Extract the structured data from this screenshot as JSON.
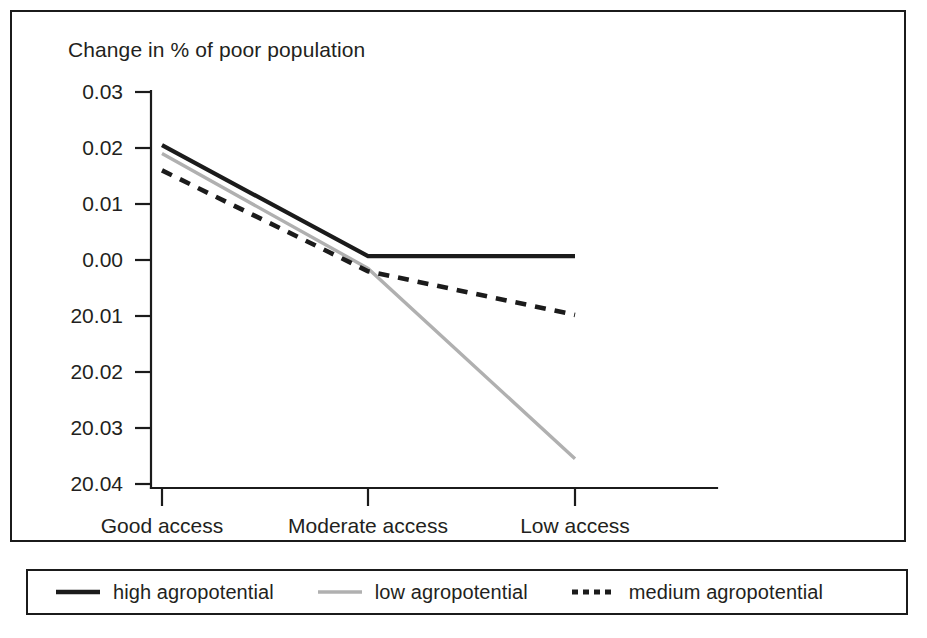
{
  "figure": {
    "title": "Change in % of poor population",
    "frame_color": "#1b1b1b",
    "background": "#ffffff"
  },
  "axes": {
    "y_tick_labels": [
      "0.03",
      "0.02",
      "0.01",
      "0.00",
      "20.01",
      "20.02",
      "20.03",
      "20.04"
    ],
    "x_tick_labels": [
      "Good access",
      "Moderate access",
      "Low access"
    ]
  },
  "legend": {
    "items": [
      {
        "label": "high agropotential",
        "color": "#1b1b1b",
        "style": "solid",
        "swatch": "legend-swatch-high"
      },
      {
        "label": "low agropotential",
        "color": "#b0b0b0",
        "style": "solid",
        "swatch": "legend-swatch-low"
      },
      {
        "label": "medium agropotential",
        "color": "#1b1b1b",
        "style": "dashed",
        "swatch": "legend-swatch-medium"
      }
    ]
  },
  "chart_data": {
    "type": "line",
    "title": "Change in % of poor population",
    "xlabel": "",
    "ylabel": "Change in % of poor population",
    "categories": [
      "Good access",
      "Moderate access",
      "Low access"
    ],
    "ytick_values": [
      0.03,
      0.02,
      0.01,
      0.0,
      -0.01,
      -0.02,
      -0.03,
      -0.04
    ],
    "ytick_labels_as_rendered": [
      "0.03",
      "0.02",
      "0.01",
      "0.00",
      "20.01",
      "20.02",
      "20.03",
      "20.04"
    ],
    "ylim": [
      -0.04,
      0.03
    ],
    "grid": false,
    "legend_position": "below-figure",
    "series": [
      {
        "name": "high agropotential",
        "color": "#1b1b1b",
        "style": "solid",
        "values": [
          0.0205,
          0.0007,
          0.0007
        ]
      },
      {
        "name": "low agropotential",
        "color": "#b0b0b0",
        "style": "solid",
        "values": [
          0.019,
          -0.0015,
          -0.0355
        ]
      },
      {
        "name": "medium agropotential",
        "color": "#1b1b1b",
        "style": "dashed",
        "values": [
          0.016,
          -0.002,
          -0.0098
        ]
      }
    ]
  }
}
